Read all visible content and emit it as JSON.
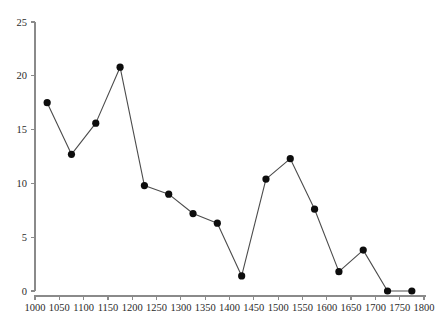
{
  "chart_data": {
    "type": "line",
    "title": "",
    "subtitle": "",
    "xlabel": "",
    "ylabel": "",
    "xlim": [
      1000,
      1800
    ],
    "ylim": [
      0,
      25
    ],
    "xticks": [
      1000,
      1050,
      1100,
      1150,
      1200,
      1250,
      1300,
      1350,
      1400,
      1450,
      1500,
      1550,
      1600,
      1650,
      1700,
      1750,
      1800
    ],
    "yticks": [
      0,
      5,
      10,
      15,
      20,
      25
    ],
    "xtick_labels": [
      "1000",
      "1050",
      "1100",
      "1150",
      "1200",
      "1250",
      "1300",
      "1350",
      "1400",
      "1450",
      "1500",
      "1550",
      "1600",
      "1650",
      "1700",
      "1750",
      "1800"
    ],
    "ytick_labels": [
      "0",
      "5",
      "10",
      "15",
      "20",
      "25"
    ],
    "grid": false,
    "legend": null,
    "legend_position": "none",
    "annotations": [],
    "marker": "filled-circle",
    "marker_color": "#0d0d0d",
    "line_color": "#4c4c4c",
    "axis_color": "#8a8a8a",
    "background_color": "#ffffff",
    "x": [
      1025,
      1075,
      1125,
      1175,
      1225,
      1275,
      1325,
      1375,
      1425,
      1475,
      1525,
      1575,
      1625,
      1675,
      1725,
      1775
    ],
    "values": [
      17.5,
      12.7,
      15.6,
      20.8,
      9.8,
      9.0,
      7.2,
      6.3,
      1.4,
      10.4,
      12.3,
      7.6,
      1.8,
      3.8,
      0.0,
      0.0
    ],
    "series": [
      {
        "name": "series-1",
        "x": [
          1025,
          1075,
          1125,
          1175,
          1225,
          1275,
          1325,
          1375,
          1425,
          1475,
          1525,
          1575,
          1625,
          1675,
          1725,
          1775
        ],
        "values": [
          17.5,
          12.7,
          15.6,
          20.8,
          9.8,
          9.0,
          7.2,
          6.3,
          1.4,
          10.4,
          12.3,
          7.6,
          1.8,
          3.8,
          0.0,
          0.0
        ]
      }
    ]
  }
}
